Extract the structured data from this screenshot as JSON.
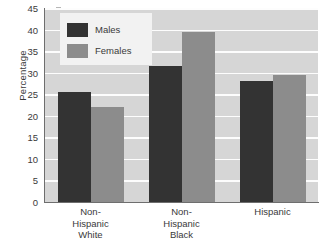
{
  "chart_data": {
    "type": "bar",
    "title": "",
    "xlabel": "",
    "ylabel": "Percentage",
    "ylim": [
      0,
      45
    ],
    "ytick_step": 5,
    "yticks": [
      0,
      5,
      10,
      15,
      20,
      25,
      30,
      35,
      40,
      45
    ],
    "grid": true,
    "legend_position": "top-left",
    "categories": [
      "Non-Hispanic White",
      "Non-Hispanic Black",
      "Hispanic"
    ],
    "category_lines": [
      [
        "Non-",
        "Hispanic",
        "White"
      ],
      [
        "Non-",
        "Hispanic",
        "Black"
      ],
      [
        "Hispanic"
      ]
    ],
    "series": [
      {
        "name": "Males",
        "values": [
          25.5,
          31.5,
          28.0
        ],
        "color": "#333333"
      },
      {
        "name": "Females",
        "values": [
          22.0,
          39.5,
          29.5
        ],
        "color": "#8c8c8c"
      }
    ]
  },
  "style": {
    "plot_background": "#d6d6d6",
    "gridline_color": "#fdfdfd",
    "axis_color": "#6e6e6e",
    "legend_background": "#f2f2f2",
    "text_color": "#3a3a3a",
    "page_background": "#ffffff"
  }
}
